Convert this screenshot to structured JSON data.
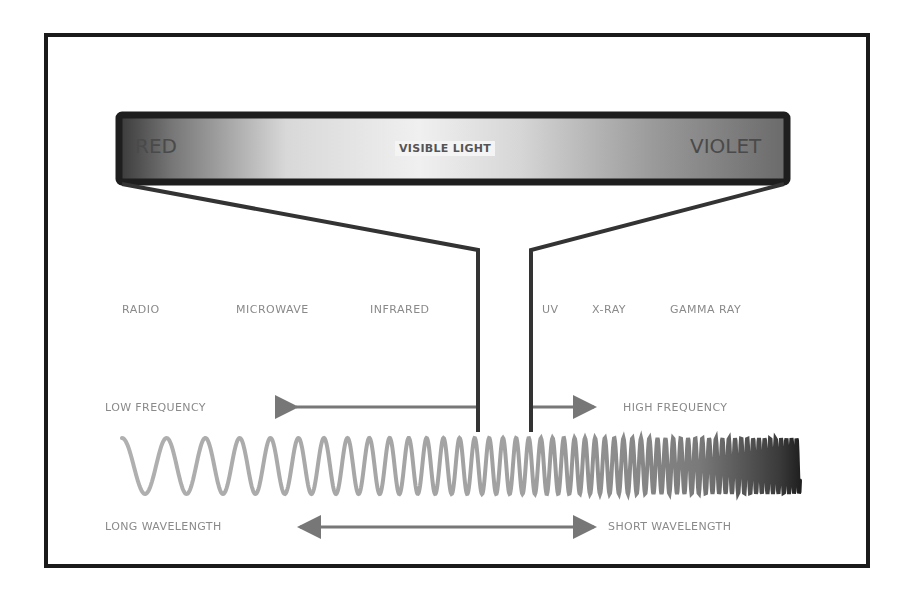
{
  "visible_bar": {
    "left_label": "RED",
    "center_label": "VISIBLE LIGHT",
    "right_label": "VIOLET"
  },
  "spectrum_bands": [
    {
      "label": "RADIO",
      "x": 122
    },
    {
      "label": "MICROWAVE",
      "x": 236
    },
    {
      "label": "INFRARED",
      "x": 370
    },
    {
      "label": "UV",
      "x": 542
    },
    {
      "label": "X-RAY",
      "x": 592
    },
    {
      "label": "GAMMA RAY",
      "x": 670
    }
  ],
  "frequency": {
    "low_label": "LOW FREQUENCY",
    "high_label": "HIGH FREQUENCY"
  },
  "wavelength": {
    "long_label": "LONG WAVELENGTH",
    "short_label": "SHORT WAVELENGTH"
  },
  "colors": {
    "frame": "#1a1a1a",
    "bar_border": "#222222",
    "funnel": "#333333",
    "wave": "#a8a8a8",
    "label_text": "#8a8a8a"
  },
  "wave": {
    "x_start": 122,
    "x_end": 800,
    "y_center": 466,
    "amplitude": 28,
    "start_period": 48,
    "end_period": 5
  }
}
